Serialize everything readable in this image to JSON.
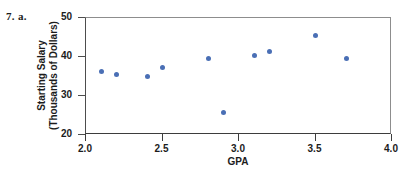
{
  "figure": {
    "problem_label": "7. a.",
    "accent_color": "#4a6fb5",
    "axis_color": "#4d4d4d"
  },
  "chart_data": {
    "type": "scatter",
    "title": "",
    "xlabel": "GPA",
    "ylabel_line1": "Starting Salary",
    "ylabel_line2": "(Thousands of Dollars)",
    "xlim": [
      2.0,
      4.0
    ],
    "ylim": [
      20,
      50
    ],
    "xticks": [
      "2.0",
      "2.5",
      "3.0",
      "3.5",
      "4.0"
    ],
    "xtick_values": [
      2.0,
      2.5,
      3.0,
      3.5,
      4.0
    ],
    "yticks": [
      "20",
      "30",
      "40",
      "50"
    ],
    "ytick_values": [
      20,
      30,
      40,
      50
    ],
    "grid": false,
    "legend": null,
    "marker": "circle",
    "marker_color": "#4a6fb5",
    "x": [
      2.1,
      2.2,
      2.4,
      2.5,
      2.8,
      2.9,
      3.1,
      3.2,
      3.5,
      3.7
    ],
    "y": [
      36.2,
      35.4,
      35.1,
      37.4,
      39.5,
      25.7,
      40.4,
      41.5,
      45.4,
      39.7
    ],
    "points": [
      {
        "gpa": 2.1,
        "salary": 36.2
      },
      {
        "gpa": 2.2,
        "salary": 35.4
      },
      {
        "gpa": 2.4,
        "salary": 35.1
      },
      {
        "gpa": 2.5,
        "salary": 37.4
      },
      {
        "gpa": 2.8,
        "salary": 39.5
      },
      {
        "gpa": 2.9,
        "salary": 25.7
      },
      {
        "gpa": 3.1,
        "salary": 40.4
      },
      {
        "gpa": 3.2,
        "salary": 41.5
      },
      {
        "gpa": 3.5,
        "salary": 45.4
      },
      {
        "gpa": 3.7,
        "salary": 39.7
      }
    ]
  }
}
